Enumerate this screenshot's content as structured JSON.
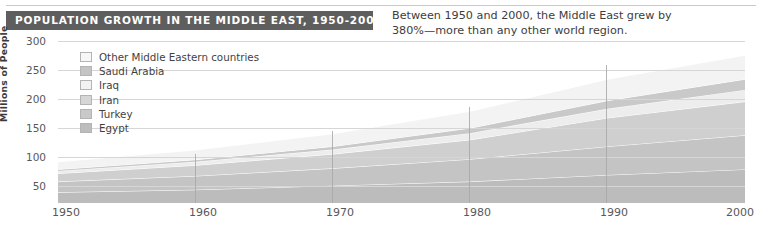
{
  "header": {
    "title": "POPULATION GROWTH IN THE MIDDLE EAST, 1950-2000",
    "subtitle_line1": "Between 1950 and 2000, the Middle East grew by",
    "subtitle_line2": "380%—more than any other world region.",
    "banner_color": "#5e5e5e",
    "banner_text_color": "#ffffff"
  },
  "chart_data": {
    "type": "area",
    "title": "POPULATION GROWTH IN THE MIDDLE EAST, 1950-2000",
    "subtitle": "Between 1950 and 2000, the Middle East grew by 380%—more than any other world region.",
    "xlabel": "",
    "ylabel": "Millions of People",
    "x": [
      1950,
      1960,
      1970,
      1980,
      1990,
      2000
    ],
    "xtick_labels": [
      "1950",
      "1960",
      "1970",
      "1980",
      "1990",
      "2000"
    ],
    "ytick_labels": [
      "50",
      "100",
      "150",
      "200",
      "250",
      "300"
    ],
    "ytick_values": [
      50,
      100,
      150,
      200,
      250,
      300
    ],
    "xlim": [
      1950,
      2000
    ],
    "ylim": [
      0,
      318
    ],
    "grid": true,
    "stacked": true,
    "legend_position": "inside-top-left",
    "series": [
      {
        "name": "Egypt",
        "color": "#bcbcbc",
        "values": [
          21,
          26,
          34,
          42,
          55,
          66
        ]
      },
      {
        "name": "Turkey",
        "color": "#c4c4c4",
        "values": [
          21,
          27,
          34,
          44,
          56,
          67
        ]
      },
      {
        "name": "Iran",
        "color": "#cfcfcf",
        "values": [
          16,
          21,
          28,
          38,
          56,
          66
        ]
      },
      {
        "name": "Iraq",
        "color": "#ededed",
        "values": [
          5,
          7,
          9,
          13,
          18,
          23
        ]
      },
      {
        "name": "Saudi Arabia",
        "color": "#c9c9c9",
        "values": [
          3,
          4,
          6,
          10,
          16,
          21
        ]
      },
      {
        "name": "Other Middle Eastern countries",
        "color": "#f3f3f3",
        "values": [
          15,
          19,
          25,
          33,
          42,
          47
        ]
      }
    ],
    "totals": [
      81,
      104,
      136,
      180,
      243,
      290
    ],
    "annotations": [
      {
        "text": "380%",
        "note": "growth 1950-2000"
      }
    ]
  },
  "legend": {
    "items": [
      {
        "label": "Other Middle Eastern countries",
        "color": "#f7f7f7"
      },
      {
        "label": "Saudi Arabia",
        "color": "#c4c4c4"
      },
      {
        "label": "Iraq",
        "color": "#f2f2f2"
      },
      {
        "label": "Iran",
        "color": "#d6d6d6"
      },
      {
        "label": "Turkey",
        "color": "#c9c9c9"
      },
      {
        "label": "Egypt",
        "color": "#bdbdbd"
      }
    ]
  },
  "axes": {
    "y_title": "Millions of People",
    "y_ticks": [
      "300",
      "250",
      "200",
      "150",
      "100",
      "50"
    ],
    "x_ticks": [
      "1950",
      "1960",
      "1970",
      "1980",
      "1990",
      "2000"
    ]
  }
}
